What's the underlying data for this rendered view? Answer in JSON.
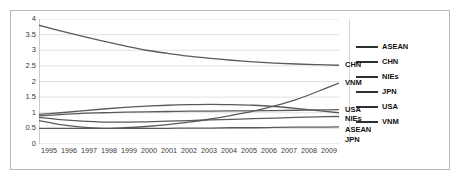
{
  "figure": {
    "title": "",
    "background": "#ffffff",
    "frame_color": "#b9b9b9",
    "line_color": "#5a5a5a",
    "grid_color": "#d9d9d9",
    "axis_color": "#9a9a9a"
  },
  "legend": {
    "position": "right",
    "items": [
      {
        "label": "ASEAN",
        "color": "#2f2f2f"
      },
      {
        "label": "CHN",
        "color": "#2f2f2f"
      },
      {
        "label": "NIEs",
        "color": "#2f2f2f"
      },
      {
        "label": "JPN",
        "color": "#2f2f2f"
      },
      {
        "label": "USA",
        "color": "#2f2f2f"
      },
      {
        "label": "VNM",
        "color": "#2f2f2f"
      }
    ]
  },
  "end_labels": [
    {
      "name": "CHN",
      "value": 2.52
    },
    {
      "name": "VNM",
      "value": 1.95
    },
    {
      "name": "USA",
      "value": 1.1
    },
    {
      "name": "NIEs",
      "value": 1.0
    },
    {
      "name": "ASEAN",
      "value": 0.88
    },
    {
      "name": "JPN",
      "value": 0.55
    }
  ],
  "chart_data": {
    "type": "line",
    "title": "",
    "xlabel": "",
    "ylabel": "",
    "xlim": [
      1995,
      2009
    ],
    "ylim": [
      0,
      4
    ],
    "ytick_step": 0.5,
    "grid": true,
    "legend_position": "right",
    "categories": [
      "1995",
      "1996",
      "1997",
      "1998",
      "1999",
      "2000",
      "2001",
      "2002",
      "2003",
      "2004",
      "2005",
      "2006",
      "2007",
      "2008",
      "2009"
    ],
    "yticks": [
      "0",
      "0.5",
      "1",
      "1.5",
      "2",
      "2.5",
      "3",
      "3.5",
      "4"
    ],
    "series": [
      {
        "name": "CHN",
        "values": [
          3.8,
          3.62,
          3.45,
          3.29,
          3.14,
          3.0,
          2.9,
          2.81,
          2.74,
          2.68,
          2.63,
          2.59,
          2.56,
          2.54,
          2.52
        ]
      },
      {
        "name": "VNM",
        "values": [
          0.75,
          0.62,
          0.54,
          0.5,
          0.52,
          0.56,
          0.62,
          0.7,
          0.8,
          0.92,
          1.05,
          1.22,
          1.42,
          1.68,
          1.95
        ]
      },
      {
        "name": "NIEs",
        "values": [
          0.95,
          1.0,
          1.06,
          1.12,
          1.17,
          1.21,
          1.24,
          1.26,
          1.27,
          1.26,
          1.24,
          1.2,
          1.14,
          1.07,
          1.0
        ]
      },
      {
        "name": "USA",
        "values": [
          0.9,
          0.94,
          0.98,
          1.0,
          1.02,
          1.03,
          1.04,
          1.05,
          1.05,
          1.06,
          1.06,
          1.07,
          1.08,
          1.09,
          1.1
        ]
      },
      {
        "name": "ASEAN",
        "values": [
          0.85,
          0.78,
          0.73,
          0.7,
          0.7,
          0.71,
          0.73,
          0.75,
          0.77,
          0.79,
          0.81,
          0.83,
          0.85,
          0.87,
          0.88
        ]
      },
      {
        "name": "JPN",
        "values": [
          0.5,
          0.5,
          0.5,
          0.5,
          0.5,
          0.5,
          0.5,
          0.51,
          0.51,
          0.52,
          0.52,
          0.53,
          0.54,
          0.54,
          0.55
        ]
      }
    ]
  }
}
